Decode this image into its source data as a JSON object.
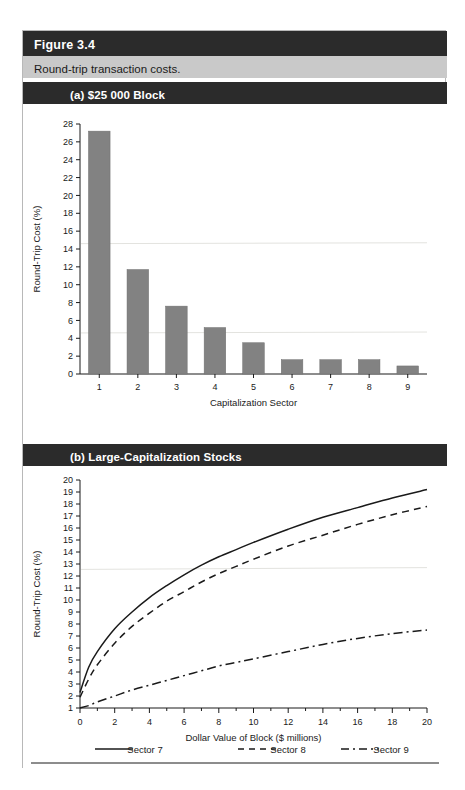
{
  "figure": {
    "number_label": "Figure 3.4",
    "caption": "Round-trip transaction costs.",
    "panel_a_label": "(a)  $25 000 Block",
    "panel_b_label": "(b)  Large-Capitalization Stocks"
  },
  "chart_data": [
    {
      "type": "bar",
      "title": "(a)  $25 000 Block",
      "xlabel": "Capitalization Sector",
      "ylabel": "Round-Trip Cost (%)",
      "categories": [
        "1",
        "2",
        "3",
        "4",
        "5",
        "6",
        "7",
        "8",
        "9"
      ],
      "values": [
        27.2,
        11.7,
        7.6,
        5.2,
        3.5,
        1.6,
        1.6,
        1.6,
        0.9
      ],
      "ylim": [
        0,
        28
      ],
      "ytick_step": 2,
      "yticks": [
        0,
        2,
        4,
        6,
        8,
        10,
        12,
        14,
        16,
        18,
        20,
        22,
        24,
        26,
        28
      ],
      "grid": false,
      "legend": "none",
      "bar_color": "#828282"
    },
    {
      "type": "line",
      "title": "(b)  Large-Capitalization Stocks",
      "xlabel": "Dollar Value of Block ($ millions)",
      "ylabel": "Round-Trip Cost (%)",
      "xlim": [
        0,
        20
      ],
      "ylim": [
        1,
        20
      ],
      "xticks": [
        0,
        2,
        4,
        6,
        8,
        10,
        12,
        14,
        16,
        18,
        20
      ],
      "yticks": [
        1,
        2,
        3,
        4,
        5,
        6,
        7,
        8,
        9,
        10,
        11,
        12,
        13,
        14,
        15,
        16,
        17,
        18,
        19,
        20
      ],
      "x": [
        0,
        0.5,
        1,
        2,
        3,
        4,
        5,
        6,
        7,
        8,
        9,
        10,
        12,
        14,
        16,
        18,
        20
      ],
      "grid": false,
      "legend_position": "bottom",
      "series": [
        {
          "name": "Sector 7",
          "style": "solid",
          "values": [
            2.3,
            4.4,
            5.7,
            7.6,
            9.0,
            10.2,
            11.2,
            12.1,
            12.9,
            13.6,
            14.2,
            14.8,
            15.9,
            16.9,
            17.7,
            18.5,
            19.2
          ]
        },
        {
          "name": "Sector 8",
          "style": "dashed",
          "values": [
            1.9,
            3.4,
            4.6,
            6.4,
            7.8,
            8.9,
            9.9,
            10.7,
            11.5,
            12.2,
            12.8,
            13.4,
            14.5,
            15.4,
            16.3,
            17.1,
            17.8
          ]
        },
        {
          "name": "Sector 9",
          "style": "dash-dot",
          "values": [
            1.0,
            1.2,
            1.5,
            2.0,
            2.5,
            2.9,
            3.3,
            3.7,
            4.1,
            4.5,
            4.8,
            5.1,
            5.7,
            6.3,
            6.8,
            7.2,
            7.5
          ]
        }
      ]
    }
  ],
  "legend": {
    "entries": [
      {
        "label": "Sector 7",
        "style": "solid"
      },
      {
        "label": "Sector 8",
        "style": "dashed"
      },
      {
        "label": "Sector 9",
        "style": "dash-dot"
      }
    ]
  }
}
